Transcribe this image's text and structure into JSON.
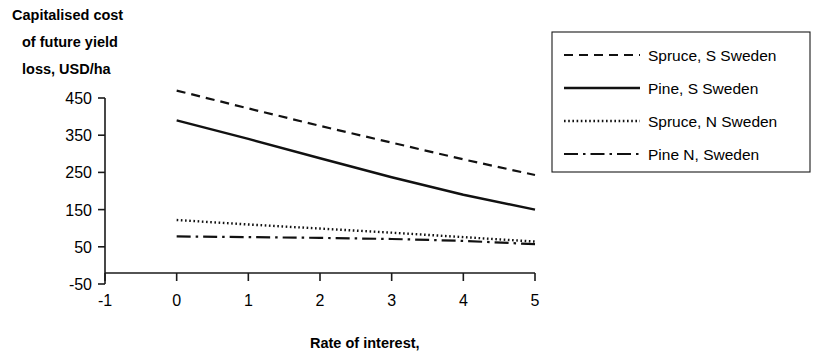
{
  "chart_data": {
    "type": "line",
    "title": "",
    "ylabel": "Capitalised cost of future yield loss, USD/ha",
    "ylabel_lines": [
      "Capitalised cost",
      "of future yield",
      "loss, USD/ha"
    ],
    "xlabel": "Rate of interest,",
    "x": [
      0,
      1,
      2,
      3,
      4,
      5
    ],
    "xlim": [
      -1,
      5
    ],
    "ylim": [
      -50,
      450
    ],
    "xticks": [
      "-1",
      "0",
      "1",
      "2",
      "3",
      "4",
      "5"
    ],
    "xtick_values": [
      -1,
      0,
      1,
      2,
      3,
      4,
      5
    ],
    "yticks": [
      "450",
      "350",
      "250",
      "150",
      "50",
      "-50"
    ],
    "ytick_values": [
      450,
      350,
      250,
      150,
      50,
      -50
    ],
    "grid": false,
    "legend_position": "right",
    "series": [
      {
        "name": "Spruce, S Sweden",
        "style": "dashed",
        "dasharray": "9,6",
        "width": 2.2,
        "values": [
          470,
          422,
          375,
          330,
          285,
          243
        ]
      },
      {
        "name": "Pine, S Sweden",
        "style": "solid",
        "dasharray": "none",
        "width": 2.4,
        "values": [
          390,
          340,
          288,
          237,
          190,
          150
        ]
      },
      {
        "name": "Spruce, N Sweden",
        "style": "dotted",
        "dasharray": "1.6,2.6",
        "width": 2.4,
        "values": [
          122,
          110,
          99,
          88,
          76,
          64
        ]
      },
      {
        "name": "Pine N, Sweden",
        "style": "dashdot",
        "dasharray": "14,5,2.5,5",
        "width": 2.2,
        "values": [
          78,
          76,
          74,
          71,
          66,
          57
        ]
      }
    ]
  },
  "legend": {
    "entries": [
      {
        "label": "Spruce, S Sweden"
      },
      {
        "label": "Pine, S Sweden"
      },
      {
        "label": "Spruce, N Sweden"
      },
      {
        "label": "Pine N, Sweden"
      }
    ]
  },
  "colors": {
    "line": "#111111",
    "axis": "#1a1a1a",
    "text": "#000000",
    "background": "#ffffff"
  }
}
